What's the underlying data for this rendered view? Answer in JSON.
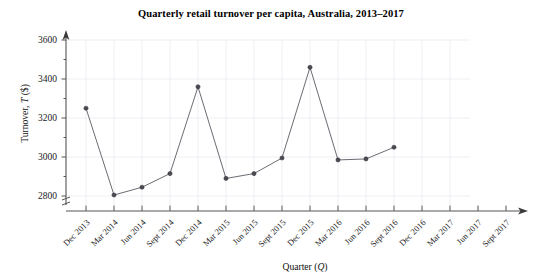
{
  "chart_data": {
    "type": "line",
    "title": "Quarterly retail turnover per capita, Australia, 2013–2017",
    "xlabel": "Quarter (Q)",
    "ylabel": "Turnover, T ($)",
    "ylabel_prefix": "Turnover, ",
    "ylabel_italic": "T",
    "ylabel_suffix": " ($)",
    "xlabel_prefix": "Quarter (",
    "xlabel_italic": "Q",
    "xlabel_suffix": ")",
    "categories": [
      "Dec 2013",
      "Mar 2014",
      "Jun 2014",
      "Sept 2014",
      "Dec 2014",
      "Mar 2015",
      "Jun 2015",
      "Sept 2015",
      "Dec 2015",
      "Mar 2016",
      "Jun 2016",
      "Sept 2016",
      "Dec 2016",
      "Mar 2017",
      "Jun 2017",
      "Sept 2017"
    ],
    "values": [
      3250,
      2805,
      2845,
      2915,
      3360,
      2890,
      2915,
      2995,
      3460,
      2985,
      2990,
      3050,
      null,
      null,
      null,
      null
    ],
    "ytick_labels": [
      "2800",
      "3000",
      "3200",
      "3400",
      "3600"
    ],
    "ytick_values": [
      2800,
      3000,
      3200,
      3400,
      3600
    ],
    "yminor_step": 100,
    "ylim": [
      2750,
      3680
    ],
    "grid": true,
    "legend": "none",
    "axis_break": true,
    "series_color": "#6b6b73",
    "marker_color": "#4a4a52",
    "grid_color": "#e8e8ef",
    "axis_color": "#555555"
  }
}
